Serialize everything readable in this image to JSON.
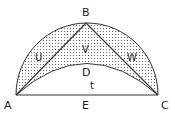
{
  "diagram": {
    "type": "geometry",
    "points": {
      "A": {
        "label": "A",
        "x": 16,
        "y": 95
      },
      "B": {
        "label": "B",
        "x": 86,
        "y": 23
      },
      "C": {
        "label": "C",
        "x": 158,
        "y": 95
      },
      "D": {
        "label": "D",
        "x": 86,
        "y": 63
      },
      "E": {
        "label": "E",
        "x": 86,
        "y": 95
      }
    },
    "regions": {
      "U": {
        "label": "U"
      },
      "V": {
        "label": "V"
      },
      "W": {
        "label": "W"
      },
      "t": {
        "label": "t"
      }
    },
    "colors": {
      "stroke": "#333333",
      "shade_dot": "#555555",
      "background": "#ffffff"
    }
  }
}
